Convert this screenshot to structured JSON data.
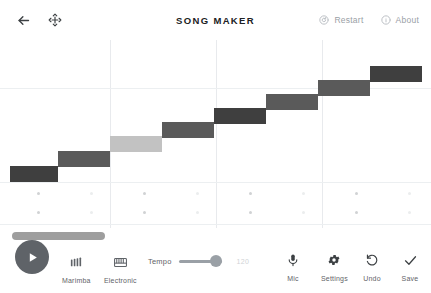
{
  "header": {
    "back_icon": "back-arrow-icon",
    "move_icon": "move-arrows-icon",
    "title": "SONG MAKER",
    "restart_label": "Restart",
    "restart_icon": "restart-circle-icon",
    "about_label": "About",
    "about_icon": "info-circle-icon"
  },
  "colors": {
    "note_dark": "#3f3f3f",
    "note_mid": "#5a5a5a",
    "note_light": "#c2c2c2",
    "gridline": "#e8eaed",
    "play_button": "#5f6368",
    "slider": "#9aa0a6",
    "text_muted": "#9aa0a6"
  },
  "grid": {
    "columns": 16,
    "bars": 4,
    "vertical_divider_x": [
      110,
      216,
      322
    ],
    "horizontal_line_y": 48,
    "melody_rows": 2,
    "percussion_rows": 2,
    "notes": [
      {
        "x": 10,
        "y": 126,
        "w": 48,
        "h": 16,
        "shade": "note_dark",
        "label": "note-1"
      },
      {
        "x": 58,
        "y": 111,
        "w": 52,
        "h": 16,
        "shade": "note_mid",
        "label": "note-2"
      },
      {
        "x": 110,
        "y": 96,
        "w": 52,
        "h": 16,
        "shade": "note_light",
        "label": "note-3"
      },
      {
        "x": 162,
        "y": 82,
        "w": 52,
        "h": 16,
        "shade": "note_mid",
        "label": "note-4"
      },
      {
        "x": 214,
        "y": 68,
        "w": 52,
        "h": 16,
        "shade": "note_dark",
        "label": "note-5"
      },
      {
        "x": 266,
        "y": 54,
        "w": 52,
        "h": 16,
        "shade": "note_mid",
        "label": "note-6"
      },
      {
        "x": 318,
        "y": 40,
        "w": 52,
        "h": 16,
        "shade": "note_mid",
        "label": "note-7"
      },
      {
        "x": 370,
        "y": 26,
        "w": 52,
        "h": 16,
        "shade": "note_dark",
        "label": "note-8"
      }
    ],
    "percussion_dot_xs": [
      37,
      90,
      143,
      196,
      249,
      302,
      355,
      408
    ],
    "percussion_dot_ys": [
      152,
      171
    ],
    "percussion_dot_shades": [
      "#d0d2d4",
      "#ebedee"
    ]
  },
  "bottom": {
    "scrollbar_label": "song-scrollbar",
    "play_label": "play-button",
    "instruments": [
      {
        "name": "Marimba",
        "icon": "marimba-bars-icon"
      },
      {
        "name": "Electronic",
        "icon": "electronic-keys-icon"
      }
    ],
    "tempo_label": "Tempo",
    "tempo_value": "120",
    "actions": [
      {
        "name": "Mic",
        "icon": "microphone-icon"
      },
      {
        "name": "Settings",
        "icon": "gear-icon"
      },
      {
        "name": "Undo",
        "icon": "undo-arrow-icon"
      },
      {
        "name": "Save",
        "icon": "checkmark-icon"
      }
    ]
  }
}
